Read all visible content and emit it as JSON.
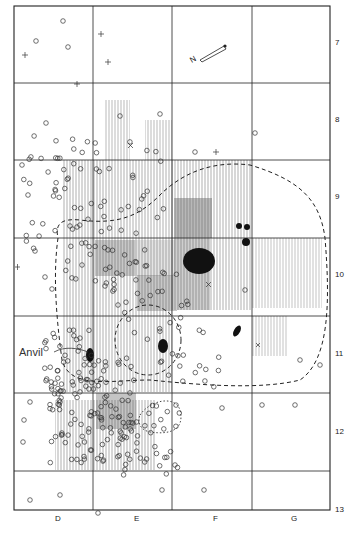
{
  "figure": {
    "type": "archaeological excavation site plan",
    "annotation": "Anvil",
    "north_arrow_label": "N",
    "grid": {
      "columns": [
        "D",
        "E",
        "F",
        "G"
      ],
      "rows": [
        "7",
        "8",
        "9",
        "10",
        "11",
        "12",
        "13"
      ]
    },
    "legend_symbols": {
      "artifact_circle": "◇",
      "plus_marker": "+",
      "cross_marker": "×"
    },
    "colors": {
      "ink": "#222222",
      "shade": "#bdbdbd",
      "feature_fill": "#111111",
      "background": "#ffffff"
    }
  }
}
